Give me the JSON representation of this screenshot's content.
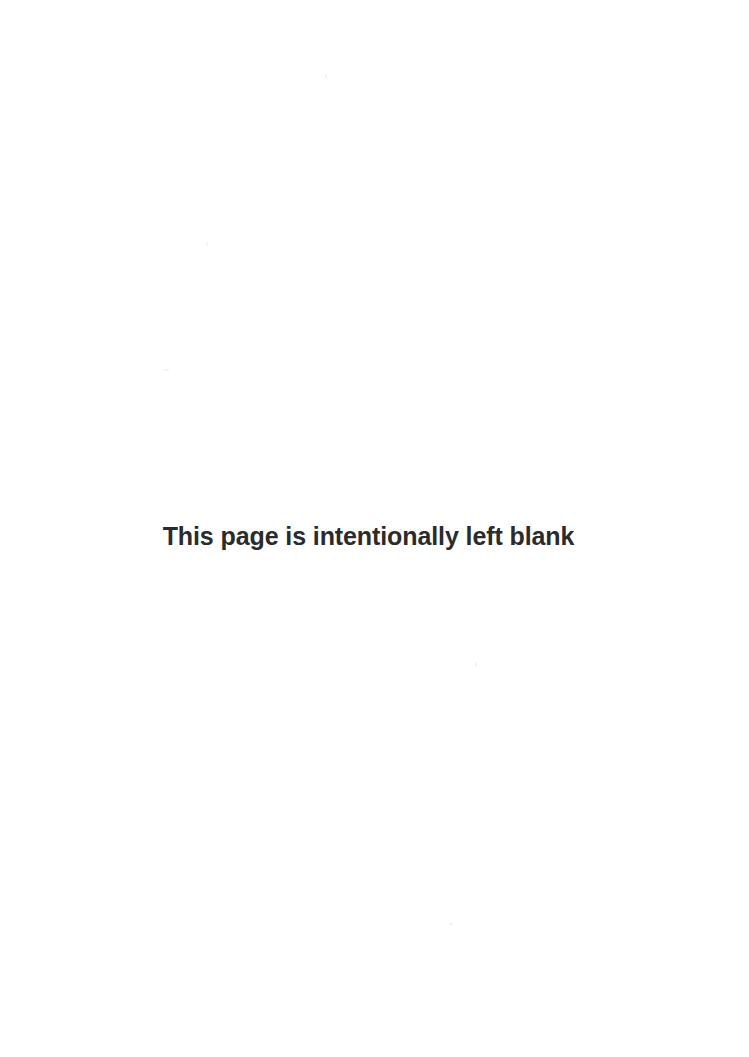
{
  "page": {
    "background_color": "#ffffff",
    "width": 749,
    "height": 1057,
    "kind": "blank-filler-page"
  },
  "notice": {
    "text": "This page is intentionally left blank",
    "color": "#2b2b2b",
    "weight": "bold",
    "align": "center"
  },
  "header": {
    "text": ""
  },
  "footer": {
    "text": ""
  },
  "artifacts": {
    "description": "faint scan speckles",
    "specks": [
      {
        "name": "speck-top-center",
        "x": 325,
        "y": 74,
        "w": 2,
        "h": 5
      },
      {
        "name": "speck-upper-left",
        "x": 206,
        "y": 242,
        "w": 2,
        "h": 4
      },
      {
        "name": "speck-mid-left",
        "x": 164,
        "y": 369,
        "w": 5,
        "h": 2
      },
      {
        "name": "speck-lower-right",
        "x": 475,
        "y": 662,
        "w": 2,
        "h": 5
      },
      {
        "name": "speck-bottom-mid",
        "x": 449,
        "y": 923,
        "w": 4,
        "h": 2
      }
    ]
  }
}
